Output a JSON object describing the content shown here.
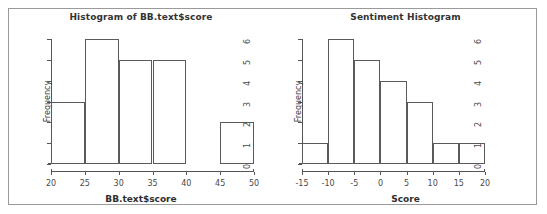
{
  "figure": {
    "background": "#ffffff",
    "frame_color": "#9a9a9a",
    "line_color": "#555555"
  },
  "chart_data": [
    {
      "type": "bar",
      "panel": "left",
      "title": "Histogram of BB.text$score",
      "xlabel": "BB.text$score",
      "ylabel": "Frequency",
      "bin_edges": [
        20,
        25,
        30,
        35,
        40,
        45,
        50
      ],
      "categories": [
        "20-25",
        "25-30",
        "30-35",
        "35-40",
        "40-45",
        "45-50"
      ],
      "values": [
        3,
        6,
        5,
        5,
        0,
        2
      ],
      "xticks": [
        20,
        25,
        30,
        35,
        40,
        45,
        50
      ],
      "xtick_labels": [
        "20",
        "25",
        "30",
        "35",
        "40",
        "45",
        "50"
      ],
      "yticks": [
        0,
        1,
        2,
        3,
        4,
        5,
        6
      ],
      "ytick_labels": [
        "0",
        "1",
        "2",
        "3",
        "4",
        "5",
        "6"
      ],
      "xlim": [
        20,
        50
      ],
      "ylim": [
        0,
        6
      ],
      "grid": false,
      "legend": false,
      "bar_fill": "#ffffff",
      "bar_edge": "#5a5a5a"
    },
    {
      "type": "bar",
      "panel": "right",
      "title": "Sentiment Histogram",
      "xlabel": "Score",
      "ylabel": "Frequency",
      "bin_edges": [
        -15,
        -10,
        -5,
        0,
        5,
        10,
        15,
        20
      ],
      "categories": [
        "-15 to -10",
        "-10 to -5",
        "-5 to 0",
        "0 to 5",
        "5 to 10",
        "10 to 15",
        "15 to 20"
      ],
      "values": [
        1,
        6,
        5,
        4,
        3,
        1,
        1
      ],
      "xticks": [
        -15,
        -10,
        -5,
        0,
        5,
        10,
        15,
        20
      ],
      "xtick_labels": [
        "-15",
        "-10",
        "-5",
        "0",
        "5",
        "10",
        "15",
        "20"
      ],
      "yticks": [
        0,
        1,
        2,
        3,
        4,
        5,
        6
      ],
      "ytick_labels": [
        "0",
        "1",
        "2",
        "3",
        "4",
        "5",
        "6"
      ],
      "xlim": [
        -15,
        20
      ],
      "ylim": [
        0,
        6
      ],
      "grid": false,
      "legend": false,
      "bar_fill": "#ffffff",
      "bar_edge": "#5a5a5a"
    }
  ]
}
